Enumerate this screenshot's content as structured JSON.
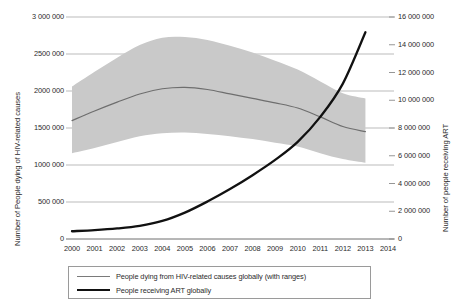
{
  "chart_data": {
    "type": "line",
    "title": "",
    "xlabel": "",
    "ylabel": "Number of People dying of HIV-related causes",
    "y2label": "Number of people receiving ART",
    "x": [
      2000,
      2001,
      2002,
      2003,
      2004,
      2005,
      2006,
      2007,
      2008,
      2009,
      2010,
      2011,
      2012,
      2013
    ],
    "xlim": [
      2000,
      2014
    ],
    "xticks": [
      "2000",
      "2001",
      "2002",
      "2003",
      "2004",
      "2005",
      "2006",
      "2007",
      "2008",
      "2009",
      "2010",
      "2011",
      "2012",
      "2013",
      "2014"
    ],
    "ylim": [
      0,
      3000000
    ],
    "yticks": [
      "0",
      "500 000",
      "1000 000",
      "1500 000",
      "2000 000",
      "2500 000",
      "3 000 000"
    ],
    "ytick_values": [
      0,
      500000,
      1000000,
      1500000,
      2000000,
      2500000,
      3000000
    ],
    "y2lim": [
      0,
      16000000
    ],
    "y2ticks": [
      "0",
      "2 000 000",
      "4 000 000",
      "6 000 000",
      "8 000 000",
      "10 000 000",
      "12 000 000",
      "14 000 000",
      "16 000 000"
    ],
    "y2tick_values": [
      0,
      2000000,
      4000000,
      6000000,
      8000000,
      10000000,
      12000000,
      14000000,
      16000000
    ],
    "grid": true,
    "legend_position": "bottom",
    "series": [
      {
        "name": "People dying from HIV-related causes globally (with ranges)",
        "axis": "left",
        "color": "#6e6e6e",
        "type": "line",
        "values": [
          1600000,
          1730000,
          1850000,
          1960000,
          2030000,
          2050000,
          2020000,
          1960000,
          1900000,
          1840000,
          1770000,
          1650000,
          1520000,
          1450000
        ],
        "range_upper": [
          2060000,
          2260000,
          2450000,
          2620000,
          2720000,
          2730000,
          2690000,
          2610000,
          2520000,
          2410000,
          2290000,
          2130000,
          1970000,
          1900000
        ],
        "range_lower": [
          1160000,
          1230000,
          1310000,
          1390000,
          1430000,
          1440000,
          1420000,
          1390000,
          1350000,
          1300000,
          1250000,
          1160000,
          1080000,
          1030000
        ],
        "range_fill": "#c9c9c9"
      },
      {
        "name": "People receiving ART globally",
        "axis": "right",
        "color": "#111111",
        "type": "line",
        "values": [
          560000,
          640000,
          760000,
          950000,
          1300000,
          1900000,
          2700000,
          3600000,
          4600000,
          5700000,
          7000000,
          8800000,
          11200000,
          14900000
        ]
      }
    ]
  },
  "legend": {
    "items": [
      {
        "label": "People dying from HIV-related causes globally (with ranges)",
        "color": "#7a7a7a",
        "thickness": "1.2px"
      },
      {
        "label": "People receiving ART globally",
        "color": "#111111",
        "thickness": "2.2px"
      }
    ]
  }
}
